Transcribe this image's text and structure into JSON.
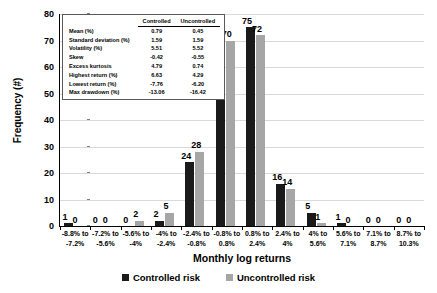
{
  "chart_data": {
    "type": "bar",
    "title": "",
    "xlabel": "Monthly log returns",
    "ylabel": "Frequency (#)",
    "ylim": [
      0,
      80
    ],
    "yticks": [
      0,
      10,
      20,
      30,
      40,
      50,
      60,
      70,
      80
    ],
    "grid": true,
    "legend_position": "bottom",
    "categories": [
      "-8.8% to -7.2%",
      "-7.2% to -5.6%",
      "-5.6% to -4%",
      "-4% to -2.4%",
      "-2.4% to -0.8%",
      "-0.8% to 0.8%",
      "0.8% to 2.4%",
      "2.4% to 4%",
      "4% to 5.6%",
      "5.6% to 7.1%",
      "7.1% to 8.7%",
      "8.7% to 10.3%"
    ],
    "category_lines": [
      [
        "-8.8% to",
        "-7.2%"
      ],
      [
        "-7.2% to",
        "-5.6%"
      ],
      [
        "-5.6% to",
        "-4%"
      ],
      [
        "-4% to",
        "-2.4%"
      ],
      [
        "-2.4% to",
        "-0.8%"
      ],
      [
        "-0.8% to",
        "0.8%"
      ],
      [
        "0.8% to",
        "2.4%"
      ],
      [
        "2.4% to",
        "4%"
      ],
      [
        "4% to",
        "5.6%"
      ],
      [
        "5.6% to",
        "7.1%"
      ],
      [
        "7.1% to",
        "8.7%"
      ],
      [
        "8.7% to",
        "10.3%"
      ]
    ],
    "series": [
      {
        "name": "Controlled risk",
        "color": "#1a1a1a",
        "values": [
          1,
          0,
          0,
          2,
          24,
          68,
          75,
          16,
          5,
          1,
          0,
          0
        ]
      },
      {
        "name": "Uncontrolled risk",
        "color": "#a6a6a6",
        "values": [
          0,
          0,
          2,
          5,
          28,
          70,
          72,
          14,
          1,
          0,
          0,
          0
        ]
      }
    ]
  },
  "stats_table": {
    "columns": [
      "",
      "Controlled",
      "Uncontrolled"
    ],
    "rows": [
      {
        "label": "Mean (%)",
        "controlled": "0.79",
        "uncontrolled": "0.45"
      },
      {
        "label": "Standard deviation (%)",
        "controlled": "1.59",
        "uncontrolled": "1.59"
      },
      {
        "label": "Volatility (%)",
        "controlled": "5.51",
        "uncontrolled": "5.52"
      },
      {
        "label": "Skew",
        "controlled": "-0.42",
        "uncontrolled": "-0.55"
      },
      {
        "label": "Excess kurtosis",
        "controlled": "4.79",
        "uncontrolled": "0.74"
      },
      {
        "label": "Highest return (%)",
        "controlled": "6.63",
        "uncontrolled": "4.29"
      },
      {
        "label": "Lowest return (%)",
        "controlled": "-7.76",
        "uncontrolled": "-6.20"
      },
      {
        "label": "Max drawdown (%)",
        "controlled": "-13.06",
        "uncontrolled": "-16.42"
      }
    ]
  },
  "legend": [
    {
      "label": "Controlled risk",
      "color": "#1a1a1a"
    },
    {
      "label": "Uncontrolled risk",
      "color": "#a6a6a6"
    }
  ]
}
